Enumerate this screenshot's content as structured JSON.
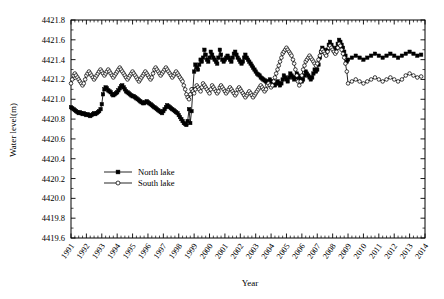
{
  "chart_data": {
    "type": "line",
    "title": "",
    "xlabel": "Year",
    "ylabel": "Water level(m)",
    "ylim": [
      4419.6,
      4421.8
    ],
    "xlim": [
      1991,
      2014
    ],
    "ytick_step": 0.2,
    "xtick_step": 1,
    "grid": false,
    "legend_position": "center-left",
    "yticks": [
      "4419.6",
      "4419.8",
      "4420.0",
      "4420.2",
      "4420.4",
      "4420.6",
      "4420.8",
      "4421.0",
      "4421.2",
      "4421.4",
      "4421.6",
      "4421.8"
    ],
    "xticks": [
      "1991",
      "1992",
      "1993",
      "1994",
      "1995",
      "1996",
      "1997",
      "1998",
      "1999",
      "2000",
      "2001",
      "2002",
      "2003",
      "2004",
      "2005",
      "2006",
      "2007",
      "2008",
      "2009",
      "2010",
      "2011",
      "2012",
      "2013",
      "2014"
    ],
    "legend": [
      {
        "name": "North lake",
        "marker": "filled-square",
        "color": "#000000"
      },
      {
        "name": "South lake",
        "marker": "open-circle",
        "color": "#000000"
      }
    ],
    "series": [
      {
        "name": "North lake",
        "marker": "filled-square",
        "color": "#000000",
        "x": [
          1991.0,
          1991.08,
          1991.17,
          1991.25,
          1991.33,
          1991.42,
          1991.5,
          1991.58,
          1991.67,
          1991.75,
          1991.83,
          1991.92,
          1992.0,
          1992.08,
          1992.17,
          1992.25,
          1992.33,
          1992.42,
          1992.5,
          1992.58,
          1992.67,
          1992.75,
          1992.83,
          1992.92,
          1993.0,
          1993.08,
          1993.17,
          1993.25,
          1993.33,
          1993.42,
          1993.5,
          1993.58,
          1993.67,
          1993.75,
          1993.83,
          1993.92,
          1994.0,
          1994.08,
          1994.17,
          1994.25,
          1994.33,
          1994.42,
          1994.5,
          1994.58,
          1994.67,
          1994.75,
          1994.83,
          1994.92,
          1995.0,
          1995.08,
          1995.17,
          1995.25,
          1995.33,
          1995.42,
          1995.5,
          1995.58,
          1995.67,
          1995.75,
          1995.83,
          1995.92,
          1996.0,
          1996.08,
          1996.17,
          1996.25,
          1996.33,
          1996.42,
          1996.5,
          1996.58,
          1996.67,
          1996.75,
          1996.83,
          1996.92,
          1997.0,
          1997.08,
          1997.17,
          1997.25,
          1997.33,
          1997.42,
          1997.5,
          1997.58,
          1997.67,
          1997.75,
          1997.83,
          1997.92,
          1998.0,
          1998.08,
          1998.17,
          1998.25,
          1998.33,
          1998.42,
          1998.5,
          1998.58,
          1998.67,
          1998.75,
          1998.83,
          1998.92,
          1999.0,
          1999.08,
          1999.17,
          1999.25,
          1999.33,
          1999.42,
          1999.5,
          1999.58,
          1999.67,
          1999.75,
          1999.83,
          1999.92,
          2000.0,
          2000.08,
          2000.17,
          2000.25,
          2000.33,
          2000.42,
          2000.5,
          2000.58,
          2000.67,
          2000.75,
          2000.83,
          2000.92,
          2001.0,
          2001.08,
          2001.17,
          2001.25,
          2001.33,
          2001.42,
          2001.5,
          2001.58,
          2001.67,
          2001.75,
          2001.83,
          2001.92,
          2002.0,
          2002.08,
          2002.17,
          2002.25,
          2002.33,
          2002.42,
          2002.5,
          2002.58,
          2002.67,
          2002.75,
          2002.83,
          2002.92,
          2003.0,
          2003.08,
          2003.17,
          2003.25,
          2003.33,
          2003.42,
          2003.5,
          2003.58,
          2003.67,
          2003.75,
          2003.83,
          2003.92,
          2004.0,
          2004.08,
          2004.17,
          2004.25,
          2004.33,
          2004.42,
          2004.5,
          2004.58,
          2004.67,
          2004.75,
          2004.83,
          2004.92,
          2005.0,
          2005.08,
          2005.17,
          2005.25,
          2005.33,
          2005.42,
          2005.5,
          2005.58,
          2005.67,
          2005.75,
          2005.83,
          2005.92,
          2006.0,
          2006.08,
          2006.17,
          2006.25,
          2006.33,
          2006.42,
          2006.5,
          2006.58,
          2006.67,
          2006.75,
          2006.83,
          2006.92,
          2007.0,
          2007.08,
          2007.17,
          2007.25,
          2007.33,
          2007.42,
          2007.5,
          2007.58,
          2007.67,
          2007.75,
          2007.83,
          2007.92,
          2008.0,
          2008.08,
          2008.17,
          2008.25,
          2008.33,
          2008.42,
          2008.5,
          2008.58,
          2008.67,
          2008.75,
          2008.83,
          2008.92,
          2009.0,
          2009.25,
          2009.5,
          2009.75,
          2010.0,
          2010.25,
          2010.5,
          2010.75,
          2011.0,
          2011.25,
          2011.5,
          2011.75,
          2012.0,
          2012.25,
          2012.5,
          2012.75,
          2013.0,
          2013.25,
          2013.5,
          2013.75
        ],
        "values": [
          4420.92,
          4420.91,
          4420.9,
          4420.89,
          4420.88,
          4420.87,
          4420.86,
          4420.87,
          4420.86,
          4420.85,
          4420.86,
          4420.85,
          4420.84,
          4420.85,
          4420.84,
          4420.83,
          4420.84,
          4420.85,
          4420.86,
          4420.85,
          4420.86,
          4420.87,
          4420.88,
          4420.9,
          4420.95,
          4421.05,
          4421.1,
          4421.12,
          4421.11,
          4421.09,
          4421.08,
          4421.07,
          4421.05,
          4421.04,
          4421.05,
          4421.06,
          4421.07,
          4421.09,
          4421.11,
          4421.13,
          4421.14,
          4421.12,
          4421.1,
          4421.08,
          4421.07,
          4421.06,
          4421.05,
          4421.04,
          4421.03,
          4421.03,
          4421.02,
          4421.01,
          4421.0,
          4420.99,
          4420.98,
          4420.97,
          4420.96,
          4420.96,
          4420.97,
          4420.98,
          4420.97,
          4420.96,
          4420.95,
          4420.94,
          4420.93,
          4420.92,
          4420.91,
          4420.9,
          4420.89,
          4420.88,
          4420.87,
          4420.86,
          4420.88,
          4420.9,
          4420.92,
          4420.94,
          4420.93,
          4420.92,
          4420.91,
          4420.9,
          4420.89,
          4420.88,
          4420.87,
          4420.86,
          4420.84,
          4420.82,
          4420.8,
          4420.78,
          4420.76,
          4420.75,
          4420.74,
          4420.78,
          4420.9,
          4420.76,
          4420.88,
          4421.1,
          4421.28,
          4421.35,
          4421.32,
          4421.3,
          4421.35,
          4421.4,
          4421.38,
          4421.42,
          4421.5,
          4421.45,
          4421.4,
          4421.38,
          4421.42,
          4421.48,
          4421.45,
          4421.42,
          4421.4,
          4421.38,
          4421.36,
          4421.42,
          4421.5,
          4421.45,
          4421.4,
          4421.38,
          4421.4,
          4421.42,
          4421.44,
          4421.42,
          4421.4,
          4421.38,
          4421.42,
          4421.46,
          4421.48,
          4421.45,
          4421.42,
          4421.4,
          4421.38,
          4421.36,
          4421.38,
          4421.42,
          4421.45,
          4421.42,
          4421.4,
          4421.38,
          4421.36,
          4421.34,
          4421.32,
          4421.3,
          4421.28,
          4421.26,
          4421.25,
          4421.24,
          4421.22,
          4421.21,
          4421.2,
          4421.19,
          4421.18,
          4421.17,
          4421.18,
          4421.2,
          4421.18,
          4421.16,
          4421.15,
          4421.14,
          4421.16,
          4421.18,
          4421.16,
          4421.14,
          4421.16,
          4421.2,
          4421.24,
          4421.22,
          4421.2,
          4421.18,
          4421.22,
          4421.26,
          4421.24,
          4421.22,
          4421.2,
          4421.22,
          4421.26,
          4421.24,
          4421.22,
          4421.2,
          4421.18,
          4421.2,
          4421.24,
          4421.28,
          4421.26,
          4421.24,
          4421.22,
          4421.2,
          4421.22,
          4421.26,
          4421.3,
          4421.28,
          4421.3,
          4421.35,
          4421.42,
          4421.48,
          4421.52,
          4421.5,
          4421.48,
          4421.46,
          4421.5,
          4421.55,
          4421.58,
          4421.55,
          4421.52,
          4421.5,
          4421.48,
          4421.52,
          4421.56,
          4421.6,
          4421.58,
          4421.55,
          4421.52,
          4421.48,
          4421.44,
          4421.38,
          4421.4,
          4421.42,
          4421.44,
          4421.42,
          4421.4,
          4421.42,
          4421.44,
          4421.46,
          4421.44,
          4421.42,
          4421.44,
          4421.46,
          4421.44,
          4421.42,
          4421.44,
          4421.46,
          4421.48,
          4421.46,
          4421.44,
          4421.45
        ]
      },
      {
        "name": "South lake",
        "marker": "open-circle",
        "color": "#000000",
        "x": [
          1991.0,
          1991.08,
          1991.17,
          1991.25,
          1991.33,
          1991.42,
          1991.5,
          1991.58,
          1991.67,
          1991.75,
          1991.83,
          1991.92,
          1992.0,
          1992.08,
          1992.17,
          1992.25,
          1992.33,
          1992.42,
          1992.5,
          1992.58,
          1992.67,
          1992.75,
          1992.83,
          1992.92,
          1993.0,
          1993.08,
          1993.17,
          1993.25,
          1993.33,
          1993.42,
          1993.5,
          1993.58,
          1993.67,
          1993.75,
          1993.83,
          1993.92,
          1994.0,
          1994.08,
          1994.17,
          1994.25,
          1994.33,
          1994.42,
          1994.5,
          1994.58,
          1994.67,
          1994.75,
          1994.83,
          1994.92,
          1995.0,
          1995.08,
          1995.17,
          1995.25,
          1995.33,
          1995.42,
          1995.5,
          1995.58,
          1995.67,
          1995.75,
          1995.83,
          1995.92,
          1996.0,
          1996.08,
          1996.17,
          1996.25,
          1996.33,
          1996.42,
          1996.5,
          1996.58,
          1996.67,
          1996.75,
          1996.83,
          1996.92,
          1997.0,
          1997.08,
          1997.17,
          1997.25,
          1997.33,
          1997.42,
          1997.5,
          1997.58,
          1997.67,
          1997.75,
          1997.83,
          1997.92,
          1998.0,
          1998.08,
          1998.17,
          1998.25,
          1998.33,
          1998.42,
          1998.5,
          1998.58,
          1998.67,
          1998.75,
          1998.83,
          1998.92,
          1999.0,
          1999.08,
          1999.17,
          1999.25,
          1999.33,
          1999.42,
          1999.5,
          1999.58,
          1999.67,
          1999.75,
          1999.83,
          1999.92,
          2000.0,
          2000.08,
          2000.17,
          2000.25,
          2000.33,
          2000.42,
          2000.5,
          2000.58,
          2000.67,
          2000.75,
          2000.83,
          2000.92,
          2001.0,
          2001.08,
          2001.17,
          2001.25,
          2001.33,
          2001.42,
          2001.5,
          2001.58,
          2001.67,
          2001.75,
          2001.83,
          2001.92,
          2002.0,
          2002.08,
          2002.17,
          2002.25,
          2002.33,
          2002.42,
          2002.5,
          2002.58,
          2002.67,
          2002.75,
          2002.83,
          2002.92,
          2003.0,
          2003.08,
          2003.17,
          2003.25,
          2003.33,
          2003.42,
          2003.5,
          2003.58,
          2003.67,
          2003.75,
          2003.83,
          2003.92,
          2004.0,
          2004.08,
          2004.17,
          2004.25,
          2004.33,
          2004.42,
          2004.5,
          2004.58,
          2004.67,
          2004.75,
          2004.83,
          2004.92,
          2005.0,
          2005.08,
          2005.17,
          2005.25,
          2005.33,
          2005.42,
          2005.5,
          2005.58,
          2005.67,
          2005.75,
          2005.83,
          2005.92,
          2006.0,
          2006.08,
          2006.17,
          2006.25,
          2006.33,
          2006.42,
          2006.5,
          2006.58,
          2006.67,
          2006.75,
          2006.83,
          2006.92,
          2007.0,
          2007.08,
          2007.17,
          2007.25,
          2007.33,
          2007.42,
          2007.5,
          2007.58,
          2007.67,
          2007.75,
          2007.83,
          2007.92,
          2008.0,
          2008.08,
          2008.17,
          2008.25,
          2008.33,
          2008.42,
          2008.5,
          2008.58,
          2008.67,
          2008.75,
          2008.83,
          2008.92,
          2009.0,
          2009.25,
          2009.5,
          2009.75,
          2010.0,
          2010.25,
          2010.5,
          2010.75,
          2011.0,
          2011.25,
          2011.5,
          2011.75,
          2012.0,
          2012.25,
          2012.5,
          2012.75,
          2013.0,
          2013.25,
          2013.5,
          2013.75
        ],
        "values": [
          4421.16,
          4421.2,
          4421.24,
          4421.26,
          4421.24,
          4421.22,
          4421.2,
          4421.18,
          4421.16,
          4421.14,
          4421.16,
          4421.2,
          4421.24,
          4421.26,
          4421.28,
          4421.26,
          4421.24,
          4421.22,
          4421.2,
          4421.22,
          4421.24,
          4421.26,
          4421.28,
          4421.3,
          4421.28,
          4421.26,
          4421.24,
          4421.26,
          4421.28,
          4421.3,
          4421.28,
          4421.26,
          4421.24,
          4421.22,
          4421.24,
          4421.26,
          4421.28,
          4421.3,
          4421.32,
          4421.3,
          4421.28,
          4421.26,
          4421.24,
          4421.22,
          4421.2,
          4421.22,
          4421.24,
          4421.26,
          4421.28,
          4421.26,
          4421.24,
          4421.22,
          4421.2,
          4421.18,
          4421.2,
          4421.22,
          4421.24,
          4421.26,
          4421.28,
          4421.26,
          4421.24,
          4421.22,
          4421.2,
          4421.22,
          4421.26,
          4421.3,
          4421.32,
          4421.3,
          4421.28,
          4421.26,
          4421.24,
          4421.26,
          4421.28,
          4421.3,
          4421.32,
          4421.3,
          4421.28,
          4421.26,
          4421.24,
          4421.22,
          4421.24,
          4421.26,
          4421.28,
          4421.26,
          4421.24,
          4421.22,
          4421.2,
          4421.18,
          4421.14,
          4421.1,
          4421.05,
          4421.02,
          4421.0,
          4421.05,
          4421.1,
          4421.08,
          4421.06,
          4421.1,
          4421.14,
          4421.12,
          4421.1,
          4421.08,
          4421.12,
          4421.16,
          4421.14,
          4421.12,
          4421.1,
          4421.08,
          4421.06,
          4421.1,
          4421.14,
          4421.12,
          4421.1,
          4421.08,
          4421.06,
          4421.08,
          4421.12,
          4421.14,
          4421.12,
          4421.1,
          4421.08,
          4421.06,
          4421.08,
          4421.1,
          4421.12,
          4421.1,
          4421.08,
          4421.06,
          4421.04,
          4421.06,
          4421.1,
          4421.12,
          4421.1,
          4421.08,
          4421.06,
          4421.04,
          4421.02,
          4421.04,
          4421.06,
          4421.08,
          4421.06,
          4421.04,
          4421.02,
          4421.04,
          4421.06,
          4421.08,
          4421.1,
          4421.12,
          4421.14,
          4421.12,
          4421.1,
          4421.08,
          4421.1,
          4421.14,
          4421.16,
          4421.14,
          4421.12,
          4421.14,
          4421.18,
          4421.22,
          4421.26,
          4421.3,
          4421.34,
          4421.38,
          4421.42,
          4421.46,
          4421.48,
          4421.5,
          4421.52,
          4421.5,
          4421.48,
          4421.46,
          4421.44,
          4421.4,
          4421.36,
          4421.3,
          4421.24,
          4421.18,
          4421.14,
          4421.18,
          4421.24,
          4421.3,
          4421.34,
          4421.38,
          4421.4,
          4421.42,
          4421.44,
          4421.42,
          4421.4,
          4421.38,
          4421.36,
          4421.34,
          4421.36,
          4421.4,
          4421.44,
          4421.48,
          4421.5,
          4421.48,
          4421.46,
          4421.44,
          4421.48,
          4421.52,
          4421.54,
          4421.52,
          4421.5,
          4421.48,
          4421.46,
          4421.48,
          4421.52,
          4421.56,
          4421.54,
          4421.5,
          4421.46,
          4421.42,
          4421.36,
          4421.28,
          4421.16,
          4421.18,
          4421.2,
          4421.18,
          4421.16,
          4421.18,
          4421.2,
          4421.22,
          4421.2,
          4421.18,
          4421.2,
          4421.22,
          4421.2,
          4421.18,
          4421.2,
          4421.24,
          4421.26,
          4421.24,
          4421.22,
          4421.23
        ]
      }
    ]
  }
}
